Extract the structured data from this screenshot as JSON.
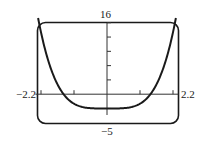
{
  "chart_data": {
    "type": "line",
    "title": "",
    "xlabel": "",
    "ylabel": "",
    "xlim": [
      -2.2,
      2.2
    ],
    "ylim": [
      -5,
      16
    ],
    "x_tick_step": 1,
    "y_tick_step": 3,
    "grid": false,
    "legend": null,
    "window_labels": {
      "xmin": "−2.2",
      "xmax": "2.2",
      "ymin": "−5",
      "ymax": "16"
    },
    "series": [
      {
        "name": "f(x) ≈ x^4 − 3",
        "x": [
          -2.2,
          -2.0,
          -1.8,
          -1.6,
          -1.4,
          -1.2,
          -1.0,
          -0.8,
          -0.6,
          -0.4,
          -0.2,
          0,
          0.2,
          0.4,
          0.6,
          0.8,
          1.0,
          1.2,
          1.4,
          1.6,
          1.8,
          2.0,
          2.2
        ],
        "y": [
          20.43,
          13.0,
          7.5,
          3.55,
          0.84,
          -0.93,
          -2.0,
          -2.59,
          -2.87,
          -2.97,
          -3.0,
          -3.0,
          -3.0,
          -2.97,
          -2.87,
          -2.59,
          -2.0,
          -0.93,
          0.84,
          3.55,
          7.5,
          13.0,
          20.43
        ]
      }
    ],
    "colors": {
      "curve": "#1a1a1a",
      "frame": "#1a1a1a",
      "axes": "#333333"
    }
  }
}
